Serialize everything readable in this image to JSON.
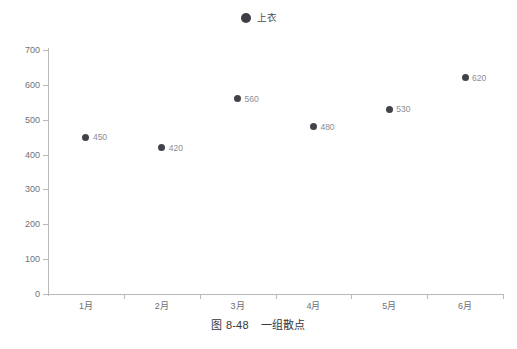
{
  "figure": {
    "caption_number": "图 8-48",
    "caption_title": "一组散点"
  },
  "legend": {
    "position": "top-center",
    "marker_icon": "filled-circle-marker",
    "items": [
      {
        "label": "上衣",
        "color": "#3e3e46"
      }
    ]
  },
  "colors": {
    "point": "#42424a",
    "point_label": "#8c8c93",
    "axis": "#b9b9bd",
    "tick_label": "#6f6f76",
    "caption": "#35353b",
    "background": "#ffffff"
  },
  "chart_data": {
    "type": "scatter",
    "title": "",
    "subtitle": "",
    "xlabel": "",
    "ylabel": "",
    "categories": [
      "1月",
      "2月",
      "3月",
      "4月",
      "5月",
      "6月"
    ],
    "series": [
      {
        "name": "上衣",
        "color": "#42424a",
        "values": [
          450,
          420,
          560,
          480,
          530,
          620
        ],
        "point_labels": [
          "450",
          "420",
          "560",
          "480",
          "530",
          "620"
        ]
      }
    ],
    "ylim": [
      0,
      700
    ],
    "ytick_values": [
      0,
      100,
      200,
      300,
      400,
      500,
      600,
      700
    ],
    "ytick_labels": [
      "0",
      "100",
      "200",
      "300",
      "400",
      "500",
      "600",
      "700"
    ],
    "grid": false,
    "legend_position": "top-center",
    "show_point_labels": true
  }
}
